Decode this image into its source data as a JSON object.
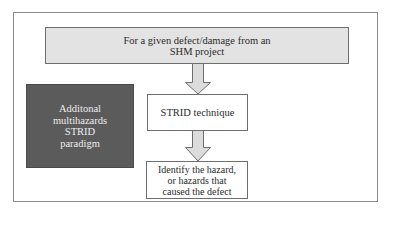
{
  "diagram": {
    "type": "flowchart",
    "nodes": [
      {
        "id": "input",
        "label": "For a given defect/damage from an\nSHM project",
        "style": "light-gray"
      },
      {
        "id": "paradigm",
        "label": "Additonal\nmultihazards\nSTRID\nparadigm",
        "style": "dark-gray"
      },
      {
        "id": "technique",
        "label": "STRID technique",
        "style": "white"
      },
      {
        "id": "result",
        "label": "Identify the hazard,\nor hazards that\ncaused the defect",
        "style": "white"
      }
    ],
    "edges": [
      {
        "from": "input",
        "to": "technique",
        "style": "block-arrow-down"
      },
      {
        "from": "technique",
        "to": "result",
        "style": "block-arrow-down"
      }
    ]
  },
  "colors": {
    "frame_border": "#8a8a8a",
    "light_box_fill": "#e3e3e3",
    "dark_box_fill": "#5b5b5b",
    "dark_box_text": "#ececec",
    "arrow_fill": "#dcdcdc",
    "arrow_stroke": "#6e6e6e"
  }
}
